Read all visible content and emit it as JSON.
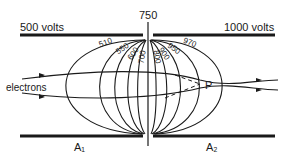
{
  "diagram": {
    "plates": {
      "top_left": "500 volts",
      "top_right": "1000 volts",
      "bottom_left": "A₁",
      "bottom_right": "A₂"
    },
    "center_label": "750",
    "beam_label": "electrons",
    "focus_point": "P",
    "equipotentials": [
      "510",
      "550",
      "600",
      "700",
      "800",
      "900",
      "950",
      "970"
    ],
    "colors": {
      "ink": "#1a1a1a",
      "background": "#ffffff"
    }
  }
}
